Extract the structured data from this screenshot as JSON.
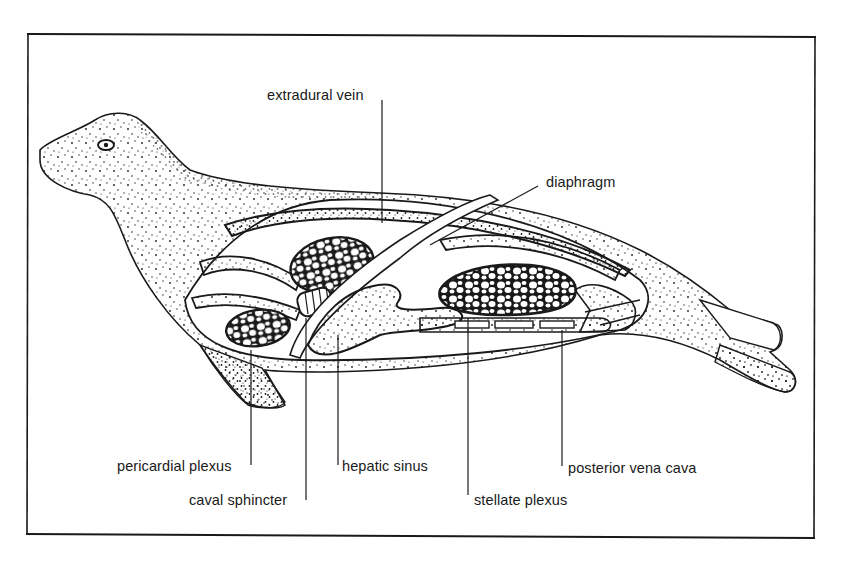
{
  "figure": {
    "colors": {
      "ink": "#1a1a1a",
      "background": "#ffffff"
    }
  },
  "labels": {
    "extradural_vein": "extradural vein",
    "diaphragm": "diaphragm",
    "pericardial_plexus": "pericardial plexus",
    "caval_sphincter": "caval sphincter",
    "hepatic_sinus": "hepatic sinus",
    "stellate_plexus": "stellate plexus",
    "posterior_vena_cava": "posterior vena cava"
  }
}
